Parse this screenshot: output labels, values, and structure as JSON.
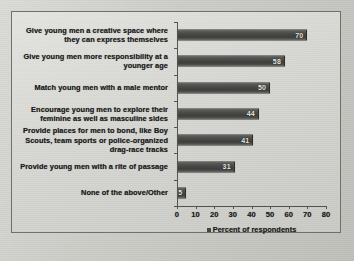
{
  "chart_data": {
    "type": "bar",
    "orientation": "horizontal",
    "title": "",
    "xlabel": "",
    "ylabel": "",
    "xlim": [
      0,
      80
    ],
    "xticks": [
      0,
      10,
      20,
      30,
      40,
      50,
      60,
      70,
      80
    ],
    "grid": false,
    "legend": {
      "position": "bottom-center",
      "entries": [
        {
          "label": "Percent of respondents",
          "color": "#46463f"
        }
      ]
    },
    "categories": [
      "Give young men a creative space where they can express themselves",
      "Give young men more responsibility at a younger age",
      "Match young men with a male mentor",
      "Encourage young men to explore their feminine as well as masculine sides",
      "Provide places for men to bond, like Boy Scouts, team sports or police-organized drag-race tracks",
      "Provide young men with a rite of passage",
      "None of the above/Other"
    ],
    "values": [
      70,
      58,
      50,
      44,
      41,
      31,
      5
    ],
    "series": [
      {
        "name": "Percent of respondents",
        "values": [
          70,
          58,
          50,
          44,
          41,
          31,
          5
        ]
      }
    ],
    "bars": [
      {
        "label": "Give young men a creative space where they can express themselves",
        "value": 70,
        "value_text": "70"
      },
      {
        "label": "Give young men more responsibility at a younger age",
        "value": 58,
        "value_text": "58"
      },
      {
        "label": "Match young men with a male mentor",
        "value": 50,
        "value_text": "50"
      },
      {
        "label": "Encourage young men to explore their feminine as well as masculine sides",
        "value": 44,
        "value_text": "44"
      },
      {
        "label": "Provide places for men to bond, like Boy Scouts, team sports or police-organized drag-race tracks",
        "value": 41,
        "value_text": "41"
      },
      {
        "label": "Provide young men with a rite of passage",
        "value": 31,
        "value_text": "31"
      },
      {
        "label": "None of the above/Other",
        "value": 5,
        "value_text": "5"
      }
    ],
    "colors": {
      "bar": "#46463f",
      "plot_background": "#d3d3cf",
      "frame_border": "#6f6f6c",
      "axis": "#55554f",
      "text": "#1b1b1b",
      "value_label_text": "#e9e9e6"
    }
  }
}
